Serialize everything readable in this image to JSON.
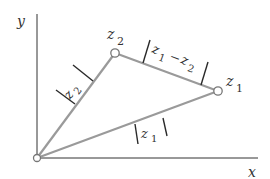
{
  "diagram": {
    "axes": {
      "x_label": "x",
      "y_label": "y"
    },
    "points": {
      "origin": {
        "x": 37,
        "y": 158
      },
      "z1": {
        "label": "z",
        "subscript": "1",
        "x": 218,
        "y": 91
      },
      "z2": {
        "label": "z",
        "subscript": "2",
        "x": 115,
        "y": 53
      }
    },
    "segment_labels": {
      "mod_z1": {
        "var": "z",
        "sub": "1",
        "text": "|z1|"
      },
      "mod_z2": {
        "var": "z",
        "sub": "2",
        "text": "|z2|"
      },
      "mod_diff": {
        "var1": "z",
        "sub1": "1",
        "op": "−",
        "var2": "z",
        "sub2": "2",
        "text": "|z1 − z2|"
      }
    },
    "colors": {
      "segment": "#9a9a9a",
      "axis": "#333333",
      "text": "#333333"
    }
  }
}
